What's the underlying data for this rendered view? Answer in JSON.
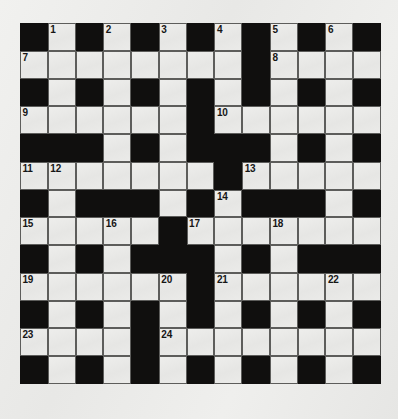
{
  "puzzle": {
    "title": "Crossword Grid",
    "rows": 13,
    "cols": 13,
    "colors": {
      "block": "#100f0e",
      "cell": "#e9e9e7",
      "cell_border": "#5d5d5b",
      "number": "#161616",
      "page_background": "#ececea"
    },
    "legend": {
      "block_char": "#",
      "open_char": "."
    },
    "grid": [
      "#.#.#.#.#.#.#",
      "........#....",
      "#.#.#.#.#.#.#",
      "......#......",
      "###.#.###.#.#",
      ".......#.....",
      "#.###.#.###.#",
      ".....#.......",
      "#.#.###.#.###",
      "......#......",
      "#.#.#.#.#.#.#",
      "....#........",
      "#.#.#.#.#.#.#"
    ],
    "numbers": [
      {
        "n": 1,
        "row": 1,
        "col": 2
      },
      {
        "n": 2,
        "row": 1,
        "col": 4
      },
      {
        "n": 3,
        "row": 1,
        "col": 6
      },
      {
        "n": 4,
        "row": 1,
        "col": 8
      },
      {
        "n": 5,
        "row": 1,
        "col": 10
      },
      {
        "n": 6,
        "row": 1,
        "col": 12
      },
      {
        "n": 7,
        "row": 2,
        "col": 1
      },
      {
        "n": 8,
        "row": 2,
        "col": 10
      },
      {
        "n": 9,
        "row": 4,
        "col": 1
      },
      {
        "n": 10,
        "row": 4,
        "col": 8
      },
      {
        "n": 11,
        "row": 6,
        "col": 1
      },
      {
        "n": 12,
        "row": 6,
        "col": 2
      },
      {
        "n": 13,
        "row": 6,
        "col": 9
      },
      {
        "n": 14,
        "row": 7,
        "col": 8
      },
      {
        "n": 15,
        "row": 8,
        "col": 1
      },
      {
        "n": 16,
        "row": 8,
        "col": 4
      },
      {
        "n": 17,
        "row": 8,
        "col": 7
      },
      {
        "n": 18,
        "row": 8,
        "col": 10
      },
      {
        "n": 19,
        "row": 10,
        "col": 1
      },
      {
        "n": 20,
        "row": 10,
        "col": 6
      },
      {
        "n": 21,
        "row": 10,
        "col": 8
      },
      {
        "n": 22,
        "row": 10,
        "col": 12
      },
      {
        "n": 23,
        "row": 12,
        "col": 1
      },
      {
        "n": 24,
        "row": 12,
        "col": 6
      }
    ]
  }
}
